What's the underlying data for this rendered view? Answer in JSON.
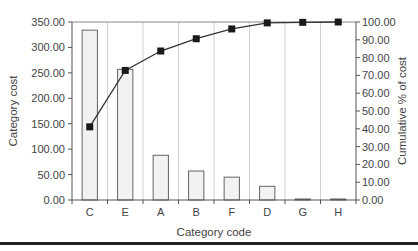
{
  "chart_data": {
    "type": "bar+line",
    "title": "",
    "xlabel": "Category code",
    "ylabel": "Category cost",
    "y2label": "Cumulative % of cost",
    "categories": [
      "C",
      "E",
      "A",
      "B",
      "F",
      "D",
      "G",
      "H"
    ],
    "series": [
      {
        "name": "Category cost",
        "type": "bar",
        "axis": "left",
        "values": [
          334,
          257,
          88,
          57,
          45,
          27,
          2,
          2
        ]
      },
      {
        "name": "Cumulative % of cost",
        "type": "line",
        "axis": "right",
        "marker": "square",
        "values": [
          41.1,
          72.8,
          83.7,
          90.6,
          96.1,
          99.5,
          99.8,
          100.0
        ]
      }
    ],
    "ylim": [
      0,
      350
    ],
    "y2lim": [
      0,
      100
    ],
    "yticks": [
      "0.00",
      "50.00",
      "100.00",
      "150.00",
      "200.00",
      "250.00",
      "300.00",
      "350.00"
    ],
    "y2ticks": [
      "0.00",
      "10.00",
      "20.00",
      "30.00",
      "40.00",
      "50.00",
      "60.00",
      "70.00",
      "80.00",
      "90.00",
      "100.00"
    ],
    "grid": "vertical category separators",
    "legend": "none",
    "colors": {
      "bar_fill": "#f2f2f2",
      "bar_stroke": "#555555",
      "line": "#333333",
      "marker": "#1a1a1a",
      "grid": "#d0d0d0",
      "axis": "#555555",
      "rule": "#222222"
    }
  }
}
